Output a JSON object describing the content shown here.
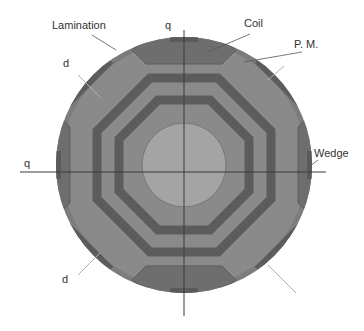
{
  "labels": {
    "lamination": "Lamination",
    "coil": "Coil",
    "pm": "P. M.",
    "wedge": "Wedge",
    "q_top": "q",
    "q_left": "q",
    "d_upper": "d",
    "d_lower": "d"
  },
  "colors": {
    "lamination": "#8a8a8a",
    "outer_ring": "#7c7c7c",
    "magnet": "#5c5c5c",
    "coil": "#6e6e6e",
    "shaft": "#a4a4a4",
    "axis": "#3a3a3a",
    "leader": "#9a9a9a"
  }
}
